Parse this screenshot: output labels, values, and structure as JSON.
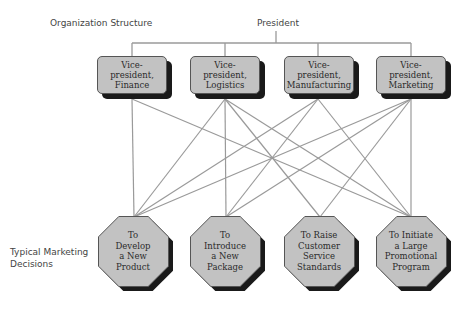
{
  "labels": {
    "organization_structure": "Organization Structure",
    "president": "President",
    "typical_marketing_decisions": [
      "Typical Marketing",
      "Decisions"
    ]
  },
  "vice_presidents": [
    {
      "id": "finance",
      "lines": [
        "Vice-",
        "president,",
        "Finance"
      ]
    },
    {
      "id": "logistics",
      "lines": [
        "Vice-",
        "president,",
        "Logistics"
      ]
    },
    {
      "id": "manufacturing",
      "lines": [
        "Vice-",
        "president,",
        "Manufacturing"
      ]
    },
    {
      "id": "marketing",
      "lines": [
        "Vice-",
        "president,",
        "Marketing"
      ]
    }
  ],
  "decisions": [
    {
      "id": "develop",
      "lines": [
        "To",
        "Develop",
        "a New",
        "Product"
      ]
    },
    {
      "id": "introduce",
      "lines": [
        "To",
        "Introduce",
        "a New",
        "Package"
      ]
    },
    {
      "id": "raise",
      "lines": [
        "To Raise",
        "Customer",
        "Service",
        "Standards"
      ]
    },
    {
      "id": "initiate",
      "lines": [
        "To Initiate",
        "a Large",
        "Promotional",
        "Program"
      ]
    }
  ],
  "connections": [
    {
      "from": "finance",
      "to": "develop"
    },
    {
      "from": "finance",
      "to": "initiate"
    },
    {
      "from": "logistics",
      "to": "develop"
    },
    {
      "from": "logistics",
      "to": "introduce"
    },
    {
      "from": "logistics",
      "to": "raise"
    },
    {
      "from": "logistics",
      "to": "initiate"
    },
    {
      "from": "manufacturing",
      "to": "develop"
    },
    {
      "from": "manufacturing",
      "to": "introduce"
    },
    {
      "from": "manufacturing",
      "to": "initiate"
    },
    {
      "from": "marketing",
      "to": "develop"
    },
    {
      "from": "marketing",
      "to": "introduce"
    },
    {
      "from": "marketing",
      "to": "raise"
    },
    {
      "from": "marketing",
      "to": "initiate"
    }
  ],
  "colors": {
    "box_fill": "#c2c2c2",
    "shadow": "#1a1a1a",
    "line": "#9a9a9a"
  }
}
